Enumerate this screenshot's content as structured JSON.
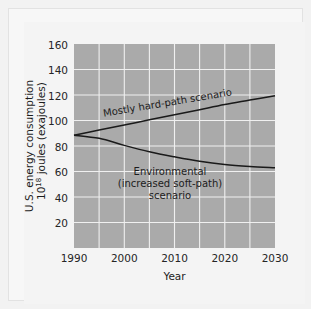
{
  "figure": {
    "background_color": "#f4f4f4",
    "plot_area_color": "#aaaaaa",
    "gridline_color": "#f0f0f0",
    "curve_color": "#1a1a1a"
  },
  "chart_data": {
    "type": "line",
    "title": "",
    "xlabel": "Year",
    "ylabel_line1": "U.S. energy consumption",
    "ylabel_line2_prefix": "10",
    "ylabel_line2_exponent": "18",
    "ylabel_line2_suffix": " joules (exajoules)",
    "xlim": [
      1990,
      2030
    ],
    "ylim": [
      0,
      160
    ],
    "xticks": [
      1990,
      2000,
      2010,
      2020,
      2030
    ],
    "xtick_labels": [
      "1990",
      "2000",
      "2010",
      "2020",
      "2030"
    ],
    "yticks": [
      20,
      40,
      60,
      80,
      100,
      120,
      140,
      160
    ],
    "ytick_labels": [
      "20",
      "40",
      "60",
      "80",
      "100",
      "120",
      "140",
      "160"
    ],
    "x_gridlines": [
      1995,
      2000,
      2005,
      2010,
      2015,
      2020,
      2025
    ],
    "y_gridlines": [
      20,
      40,
      60,
      80,
      100,
      120,
      140
    ],
    "grid": true,
    "legend_position": "inline-annotations",
    "x": [
      1990,
      1995,
      2000,
      2005,
      2010,
      2015,
      2020,
      2025,
      2030
    ],
    "series": [
      {
        "name": "Mostly hard-path scenario",
        "label_text": "Mostly hard-path scenario",
        "label_rotation_deg": -9.5,
        "values": [
          88.5,
          92.5,
          96.5,
          100.5,
          104.5,
          108.5,
          112.5,
          116.0,
          119.5
        ]
      },
      {
        "name": "Environmental (increased soft-path) scenario",
        "label_line1": "Environmental",
        "label_line2": "(increased soft-path)",
        "label_line3": "scenario",
        "values": [
          88.5,
          86.0,
          80.5,
          75.5,
          71.5,
          68.0,
          65.5,
          64.0,
          63.0
        ]
      }
    ]
  }
}
